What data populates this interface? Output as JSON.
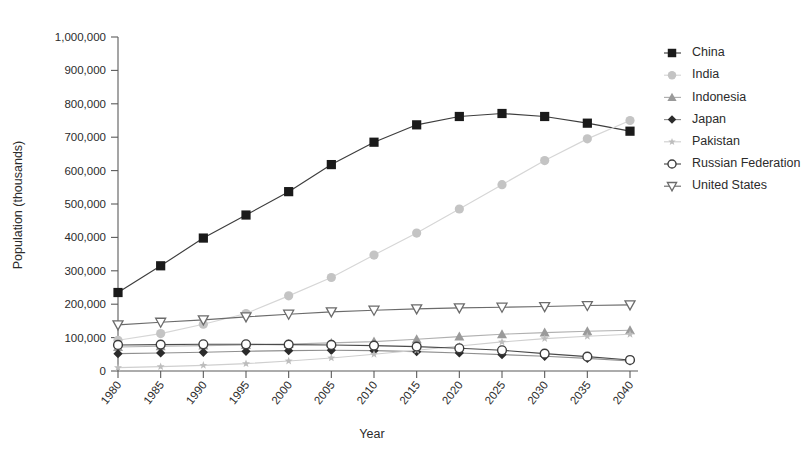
{
  "chart_data": {
    "type": "line",
    "title": "",
    "xlabel": "Year",
    "ylabel": "Population (thousands)",
    "x": [
      1980,
      1985,
      1990,
      1995,
      2000,
      2005,
      2010,
      2015,
      2020,
      2025,
      2030,
      2035,
      2040
    ],
    "xtick_labels": [
      "1980",
      "1985",
      "1990",
      "1995",
      "2000",
      "2005",
      "2010",
      "2015",
      "2020",
      "2025",
      "2030",
      "2035",
      "2040"
    ],
    "ytick_labels": [
      "0",
      "100,000",
      "200,000",
      "300,000",
      "400,000",
      "500,000",
      "600,000",
      "700,000",
      "800,000",
      "900,000",
      "1,000,000"
    ],
    "ytick_values": [
      0,
      100000,
      200000,
      300000,
      400000,
      500000,
      600000,
      700000,
      800000,
      900000,
      1000000
    ],
    "xlim": [
      1980,
      2040
    ],
    "ylim": [
      0,
      1000000
    ],
    "grid": false,
    "legend_position": "right",
    "series": [
      {
        "name": "China",
        "marker": "filled-square",
        "color": "#1a1a1a",
        "line_color": "#3d3d3d",
        "values": [
          235000,
          315000,
          398000,
          467000,
          537000,
          618000,
          685000,
          737000,
          762000,
          771000,
          762000,
          742000,
          718000
        ]
      },
      {
        "name": "India",
        "marker": "filled-circle",
        "color": "#c4c4c4",
        "line_color": "#d6d6d6",
        "values": [
          92000,
          112000,
          140000,
          172000,
          225000,
          280000,
          347000,
          413000,
          485000,
          558000,
          630000,
          695000,
          750000
        ]
      },
      {
        "name": "Indonesia",
        "marker": "filled-triangle-up",
        "color": "#9a9a9a",
        "line_color": "#b0b0b0",
        "values": [
          72000,
          74000,
          76000,
          78000,
          81000,
          84000,
          88000,
          95000,
          103000,
          110000,
          115000,
          119000,
          122000
        ]
      },
      {
        "name": "Japan",
        "marker": "filled-diamond",
        "color": "#2b2b2b",
        "line_color": "#8f8f8f",
        "values": [
          52000,
          54000,
          56000,
          59000,
          61000,
          62000,
          61000,
          58000,
          54000,
          49000,
          44000,
          38000,
          30000
        ]
      },
      {
        "name": "Pakistan",
        "marker": "star",
        "color": "#bdbdbd",
        "line_color": "#cfcfcf",
        "values": [
          10000,
          13000,
          17000,
          22000,
          30000,
          39000,
          50000,
          62000,
          75000,
          87000,
          97000,
          104000,
          110000
        ]
      },
      {
        "name": "Russian Federation",
        "marker": "open-circle",
        "color": "#3d3d3d",
        "line_color": "#4a4a4a",
        "values": [
          78000,
          79000,
          80000,
          80000,
          79000,
          78000,
          76000,
          73000,
          68000,
          62000,
          52000,
          43000,
          33000
        ]
      },
      {
        "name": "United States",
        "marker": "open-triangle-down",
        "color": "#6b6b6b",
        "line_color": "#6b6b6b",
        "values": [
          138000,
          146000,
          153000,
          162000,
          170000,
          177000,
          182000,
          186000,
          189000,
          191000,
          193000,
          196000,
          198000
        ]
      }
    ]
  }
}
